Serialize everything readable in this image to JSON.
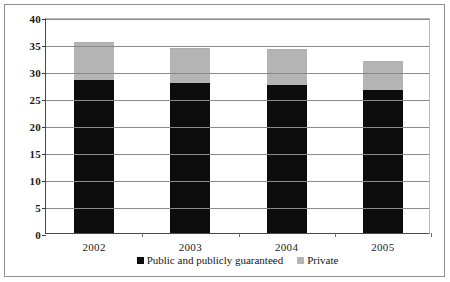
{
  "chart_data": {
    "type": "bar",
    "subtype": "stacked-column",
    "title": "",
    "subtitle": "",
    "xlabel": "",
    "ylabel": "",
    "categories": [
      "2002",
      "2003",
      "2004",
      "2005"
    ],
    "series": [
      {
        "name": "Public and publicly guaranteed",
        "color": "#0c0c0c",
        "values": [
          28.3,
          27.8,
          27.5,
          26.4
        ]
      },
      {
        "name": "Private",
        "color": "#b4b4b4",
        "values": [
          7.0,
          6.5,
          6.5,
          5.5
        ]
      }
    ],
    "totals": [
      35.3,
      34.3,
      34.0,
      31.9
    ],
    "ylim": [
      0,
      40
    ],
    "yticks": [
      0,
      5,
      10,
      15,
      20,
      25,
      30,
      35,
      40
    ],
    "ytick_labels": [
      "0",
      "5",
      "10",
      "15",
      "20",
      "25",
      "30",
      "35",
      "40"
    ],
    "grid": true,
    "grid_axis": "y",
    "legend_position": "bottom-center"
  },
  "legend": {
    "items": [
      {
        "label": "Public and publicly guaranteed",
        "swatch": "black-square-marker"
      },
      {
        "label": "Private",
        "swatch": "gray-square-marker"
      }
    ]
  }
}
